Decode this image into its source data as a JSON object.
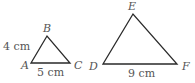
{
  "diagram": {
    "type": "similar-triangles",
    "triangles": [
      {
        "name": "ABC",
        "vertices": {
          "A": {
            "label": "A",
            "x": 31,
            "y": 63
          },
          "B": {
            "label": "B",
            "x": 47,
            "y": 36
          },
          "C": {
            "label": "C",
            "x": 70,
            "y": 63
          }
        },
        "side_labels": {
          "AB": "4 cm",
          "AC": "5 cm"
        }
      },
      {
        "name": "DEF",
        "vertices": {
          "D": {
            "label": "D",
            "x": 103,
            "y": 64
          },
          "E": {
            "label": "E",
            "x": 133,
            "y": 14
          },
          "F": {
            "label": "F",
            "x": 177,
            "y": 64
          }
        },
        "side_labels": {
          "DF": "9 cm"
        }
      }
    ],
    "colors": {
      "line": "#2a2a2a",
      "text": "#555555"
    }
  }
}
